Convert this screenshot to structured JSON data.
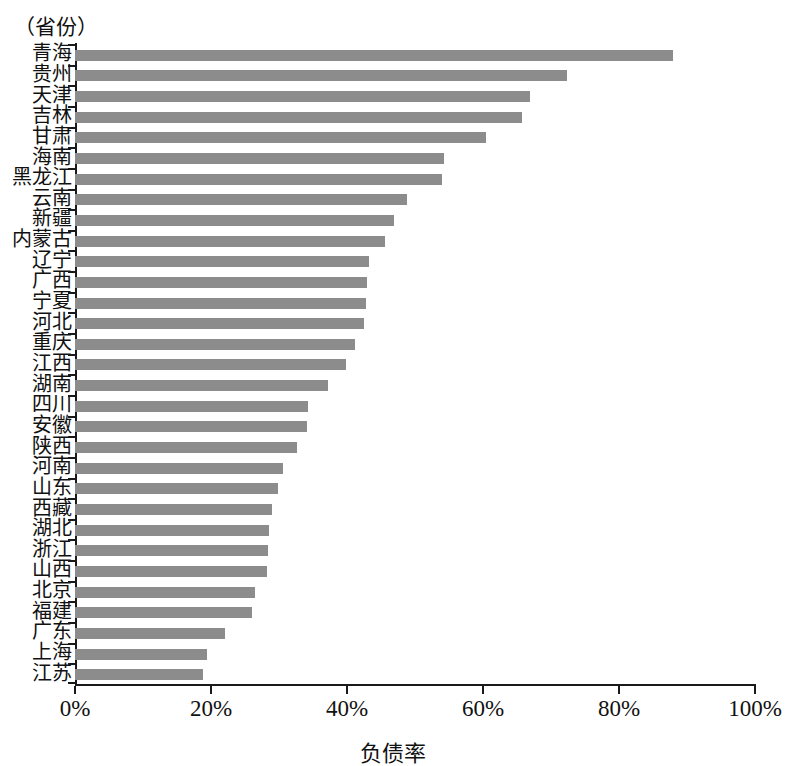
{
  "axis": {
    "y_caption": "（省份）",
    "x_title": "负债率",
    "x_ticks": [
      "0%",
      "20%",
      "40%",
      "60%",
      "80%",
      "100%"
    ]
  },
  "style": {
    "bar_color": "#8c8c8c",
    "axis_color": "#1a1a1a",
    "background": "#ffffff"
  },
  "chart_data": {
    "type": "bar",
    "orientation": "horizontal",
    "title": "",
    "subtitle": "",
    "xlabel": "负债率",
    "ylabel": "（省份）",
    "xlim": [
      0,
      100
    ],
    "xticks": [
      0,
      20,
      40,
      60,
      80,
      100
    ],
    "xtick_labels": [
      "0%",
      "20%",
      "40%",
      "60%",
      "80%",
      "100%"
    ],
    "grid": false,
    "legend": null,
    "unit": "%",
    "categories": [
      "青海",
      "贵州",
      "天津",
      "吉林",
      "甘肃",
      "海南",
      "黑龙江",
      "云南",
      "新疆",
      "内蒙古",
      "辽宁",
      "广西",
      "宁夏",
      "河北",
      "重庆",
      "江西",
      "湖南",
      "四川",
      "安徽",
      "陕西",
      "河南",
      "山东",
      "西藏",
      "湖北",
      "浙江",
      "山西",
      "北京",
      "福建",
      "广东",
      "上海",
      "江苏"
    ],
    "values": [
      88.0,
      72.4,
      66.9,
      65.7,
      60.4,
      54.3,
      54.0,
      48.8,
      46.9,
      45.6,
      43.2,
      43.0,
      42.8,
      42.5,
      41.2,
      39.9,
      37.2,
      34.3,
      34.1,
      32.6,
      30.6,
      29.9,
      29.0,
      28.5,
      28.4,
      28.2,
      26.4,
      26.0,
      22.0,
      19.4,
      18.8
    ]
  }
}
